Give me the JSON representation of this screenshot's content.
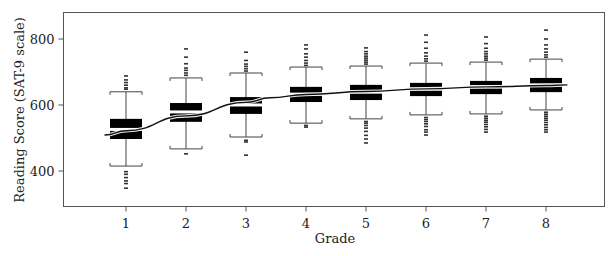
{
  "chart_data": {
    "type": "boxplot",
    "title": "",
    "xlabel": "Grade",
    "ylabel": "Reading Score (SAT-9 scale)",
    "ylim": [
      291,
      882
    ],
    "xlim": [
      0.55,
      9.3
    ],
    "grid": false,
    "legend": "none",
    "categories": [
      "1",
      "2",
      "3",
      "4",
      "5",
      "6",
      "7",
      "8"
    ],
    "x_ticks": [
      "1",
      "2",
      "3",
      "4",
      "5",
      "6",
      "7",
      "8"
    ],
    "y_ticks": [
      400,
      600,
      800
    ],
    "y_tick_labels": [
      "400",
      "600",
      "800"
    ],
    "boxes": [
      {
        "grade": "1",
        "whisker_low": 415,
        "q1": 497,
        "median": 526,
        "q3": 558,
        "whisker_high": 640,
        "outliers_high": [
          648,
          652,
          660,
          668,
          676,
          688
        ],
        "outliers_low": [
          398,
          390,
          380,
          370,
          362,
          348
        ]
      },
      {
        "grade": "2",
        "whisker_low": 467,
        "q1": 549,
        "median": 579,
        "q3": 606,
        "whisker_high": 682,
        "outliers_high": [
          690,
          697,
          705,
          712,
          725,
          745,
          770
        ],
        "outliers_low": [
          452
        ]
      },
      {
        "grade": "3",
        "whisker_low": 503,
        "q1": 573,
        "median": 600,
        "q3": 624,
        "whisker_high": 697,
        "outliers_high": [
          703,
          710,
          717,
          724,
          735,
          760
        ],
        "outliers_low": [
          493,
          488,
          448
        ]
      },
      {
        "grade": "4",
        "whisker_low": 545,
        "q1": 609,
        "median": 633,
        "q3": 655,
        "whisker_high": 715,
        "outliers_high": [
          720,
          727,
          735,
          745,
          755,
          770,
          782
        ],
        "outliers_low": [
          533,
          538
        ]
      },
      {
        "grade": "5",
        "whisker_low": 558,
        "q1": 615,
        "median": 639,
        "q3": 661,
        "whisker_high": 718,
        "outliers_high": [
          724,
          730,
          736,
          742,
          748,
          755,
          762,
          773
        ],
        "outliers_low": [
          550,
          545,
          538,
          530,
          520,
          508,
          497,
          485
        ]
      },
      {
        "grade": "6",
        "whisker_low": 570,
        "q1": 627,
        "median": 648,
        "q3": 667,
        "whisker_high": 727,
        "outliers_high": [
          733,
          740,
          748,
          758,
          772,
          790,
          812
        ],
        "outliers_low": [
          562,
          556,
          550,
          543,
          535,
          525,
          518,
          509
        ]
      },
      {
        "grade": "7",
        "whisker_low": 573,
        "q1": 633,
        "median": 655,
        "q3": 673,
        "whisker_high": 730,
        "outliers_high": [
          736,
          742,
          748,
          755,
          762,
          772,
          786,
          806
        ],
        "outliers_low": [
          566,
          560,
          554,
          548,
          541,
          534,
          526,
          518
        ]
      },
      {
        "grade": "8",
        "whisker_low": 585,
        "q1": 639,
        "median": 661,
        "q3": 682,
        "whisker_high": 739,
        "outliers_high": [
          745,
          752,
          760,
          770,
          782,
          800,
          827
        ],
        "outliers_low": [
          578,
          572,
          566,
          560,
          554,
          547,
          540,
          532,
          525,
          518
        ]
      }
    ],
    "trend_line": {
      "x": [
        0.65,
        1,
        2,
        3,
        3.4,
        4,
        5,
        6,
        7,
        8,
        8.35
      ],
      "y": [
        509,
        522,
        567,
        608,
        622,
        632,
        641,
        649,
        655,
        659,
        661
      ]
    }
  }
}
